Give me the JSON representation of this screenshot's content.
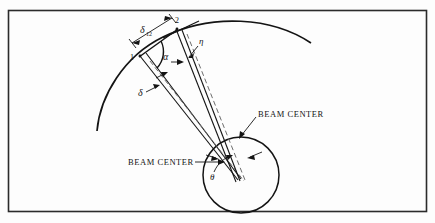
{
  "figure": {
    "background_color": "#fdfdfd",
    "ink_color": "#141414",
    "frame": {
      "name": "figure-border",
      "x": 8,
      "y": 10,
      "width": 419,
      "height": 202,
      "stroke_color": "#2b2b2b"
    },
    "labels": {
      "point_one": "1",
      "point_two": "2",
      "delta_12": "δ",
      "delta_12_subscript": "12",
      "alpha": "α",
      "eta": "η",
      "delta": "δ",
      "theta": "θ",
      "beam_center_upper": "BEAM CENTER",
      "beam_center_lower": "BEAM CENTER"
    },
    "geometry": {
      "surface_arc": "large circular arc representing the curved surface",
      "detector_circle": {
        "cx": 241,
        "cy": 175,
        "r": 38
      },
      "point_one_coords": {
        "x": 140,
        "y": 56
      },
      "point_two_coords": {
        "x": 176,
        "y": 29
      }
    }
  }
}
